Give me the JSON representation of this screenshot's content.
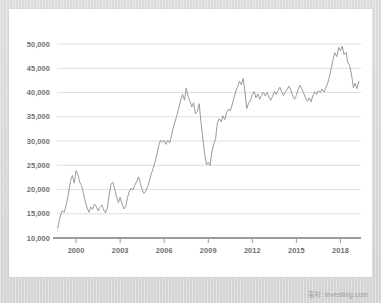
{
  "watermark": {
    "text": "출처: Investing.com"
  },
  "colors": {
    "frame": "#d9d9d9",
    "card": "#ffffff",
    "line": "#9b9b9b",
    "grid": "#d7d7d7",
    "axis": "#7a7a7a",
    "label": "#6e6e6e"
  },
  "chart_data": {
    "type": "line",
    "title": "",
    "subtitle": "",
    "xlabel": "",
    "ylabel": "",
    "grid": true,
    "legend": false,
    "legend_position": "none",
    "xlim": [
      1998.7,
      2019.4
    ],
    "ylim": [
      10000,
      50000
    ],
    "ytick_labels": [
      "10,000",
      "15,000",
      "20,000",
      "25,000",
      "30,000",
      "35,000",
      "40,000",
      "45,000",
      "50,000"
    ],
    "yticks": [
      10000,
      15000,
      20000,
      25000,
      30000,
      35000,
      40000,
      45000,
      50000
    ],
    "xtick_labels": [
      "2000",
      "2003",
      "2006",
      "2009",
      "2012",
      "2015",
      "2018"
    ],
    "xticks": [
      2000,
      2003,
      2006,
      2009,
      2012,
      2015,
      2018
    ],
    "series": [
      {
        "name": "index",
        "x": [
          1998.75,
          1998.9,
          1999.05,
          1999.2,
          1999.35,
          1999.5,
          1999.62,
          1999.75,
          1999.88,
          2000.0,
          2000.12,
          2000.25,
          2000.38,
          2000.5,
          2000.62,
          2000.75,
          2000.88,
          2001.0,
          2001.12,
          2001.25,
          2001.38,
          2001.5,
          2001.62,
          2001.75,
          2001.88,
          2002.0,
          2002.12,
          2002.25,
          2002.38,
          2002.5,
          2002.62,
          2002.75,
          2002.88,
          2003.0,
          2003.12,
          2003.25,
          2003.38,
          2003.5,
          2003.62,
          2003.75,
          2003.88,
          2004.0,
          2004.12,
          2004.25,
          2004.38,
          2004.5,
          2004.62,
          2004.75,
          2004.88,
          2005.0,
          2005.12,
          2005.25,
          2005.38,
          2005.5,
          2005.62,
          2005.75,
          2005.88,
          2006.0,
          2006.12,
          2006.25,
          2006.38,
          2006.5,
          2006.62,
          2006.75,
          2006.88,
          2007.0,
          2007.12,
          2007.25,
          2007.38,
          2007.5,
          2007.62,
          2007.75,
          2007.88,
          2008.0,
          2008.12,
          2008.25,
          2008.38,
          2008.5,
          2008.62,
          2008.75,
          2008.88,
          2009.0,
          2009.12,
          2009.25,
          2009.38,
          2009.5,
          2009.62,
          2009.75,
          2009.88,
          2010.0,
          2010.12,
          2010.25,
          2010.38,
          2010.5,
          2010.62,
          2010.75,
          2010.88,
          2011.0,
          2011.12,
          2011.25,
          2011.38,
          2011.5,
          2011.62,
          2011.75,
          2011.88,
          2012.0,
          2012.12,
          2012.25,
          2012.38,
          2012.5,
          2012.62,
          2012.75,
          2012.88,
          2013.0,
          2013.12,
          2013.25,
          2013.38,
          2013.5,
          2013.62,
          2013.75,
          2013.88,
          2014.0,
          2014.12,
          2014.25,
          2014.38,
          2014.5,
          2014.62,
          2014.75,
          2014.88,
          2015.0,
          2015.12,
          2015.25,
          2015.38,
          2015.5,
          2015.62,
          2015.75,
          2015.88,
          2016.0,
          2016.12,
          2016.25,
          2016.38,
          2016.5,
          2016.62,
          2016.75,
          2016.88,
          2017.0,
          2017.12,
          2017.25,
          2017.38,
          2017.5,
          2017.62,
          2017.75,
          2017.88,
          2018.0,
          2018.12,
          2018.25,
          2018.38,
          2018.5,
          2018.62,
          2018.75,
          2018.88,
          2019.0,
          2019.12,
          2019.25
        ],
        "values": [
          12000,
          14300,
          15600,
          15300,
          17200,
          19500,
          21800,
          22900,
          21300,
          23900,
          23100,
          21500,
          20800,
          19200,
          17600,
          16200,
          15300,
          16400,
          15900,
          17000,
          16500,
          15600,
          16300,
          16800,
          15800,
          15200,
          16100,
          18900,
          21100,
          21500,
          20200,
          18500,
          17300,
          18400,
          17200,
          16000,
          16500,
          18300,
          19600,
          20300,
          19900,
          20900,
          21600,
          22600,
          21200,
          20000,
          19200,
          19700,
          20600,
          21900,
          23200,
          24400,
          25700,
          27300,
          28900,
          30200,
          29800,
          30100,
          29300,
          30200,
          29600,
          31200,
          32800,
          34100,
          35500,
          36800,
          38500,
          39600,
          38400,
          40900,
          39200,
          38200,
          37000,
          37900,
          35600,
          36100,
          37700,
          34000,
          30800,
          27400,
          25100,
          25600,
          24900,
          27800,
          29400,
          30500,
          33800,
          34600,
          34000,
          35200,
          34400,
          35800,
          36600,
          36200,
          37400,
          38900,
          40300,
          41200,
          42300,
          41600,
          42900,
          40100,
          36700,
          37800,
          38500,
          39600,
          40200,
          38900,
          39700,
          38600,
          39400,
          40100,
          39300,
          40000,
          39100,
          38400,
          39200,
          40300,
          39600,
          40400,
          41100,
          40200,
          39400,
          40100,
          40700,
          41300,
          40500,
          39300,
          38600,
          39400,
          40600,
          41500,
          40700,
          39800,
          38900,
          38200,
          38900,
          38100,
          39300,
          40200,
          39600,
          40400,
          40000,
          40700,
          40100,
          40900,
          41800,
          43200,
          45100,
          46900,
          48200,
          47400,
          49300,
          48600,
          49500,
          47800,
          48300,
          46200,
          45600,
          43800,
          41000,
          41900,
          40800,
          42300
        ]
      }
    ]
  }
}
